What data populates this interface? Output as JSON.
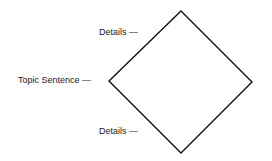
{
  "diagram": {
    "shape": "diamond",
    "stroke_color": "#111111",
    "labels": {
      "top_details": "Details —",
      "topic_sentence": "Topic Sentence —",
      "bottom_details": "Details —"
    }
  }
}
